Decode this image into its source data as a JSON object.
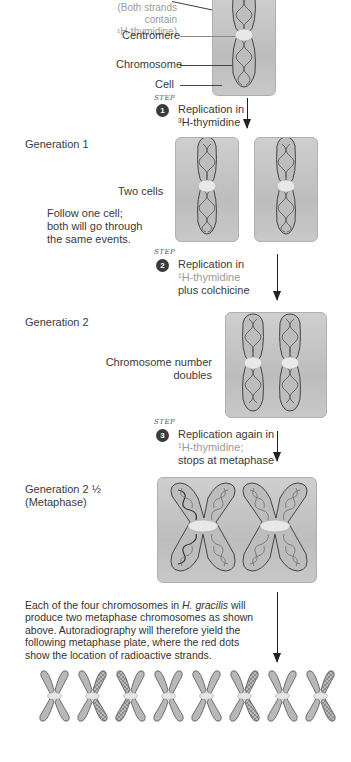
{
  "top": {
    "strands_note_line1": "(Both strands contain",
    "strands_note_line2": "¹H-thymidine)",
    "centromere_label": "Centromere",
    "chromosome_label": "Chromosome",
    "cell_label": "Cell"
  },
  "steps": [
    {
      "tag": "STEP",
      "number": "1",
      "line1": "Replication in",
      "line2": "³H-thymidine",
      "line3": ""
    },
    {
      "tag": "STEP",
      "number": "2",
      "line1": "Replication in",
      "line2": "¹H-thymidine",
      "line3": "plus colchicine"
    },
    {
      "tag": "STEP",
      "number": "3",
      "line1": "Replication again in",
      "line2": "¹H-thymidine;",
      "line3": "stops at metaphase"
    }
  ],
  "generation1": {
    "title": "Generation 1",
    "two_cells_label": "Two cells",
    "follow_line1": "Follow one cell;",
    "follow_line2": "both will go through",
    "follow_line3": "the same events."
  },
  "generation2": {
    "title": "Generation 2",
    "doubles_line1": "Chromosome number",
    "doubles_line2": "doubles"
  },
  "generation2_5": {
    "title_line1": "Generation 2 ½",
    "title_line2": "(Metaphase)"
  },
  "conclusion": {
    "line1_pre": "Each of the four chromosomes in ",
    "species": "H. gracilis",
    "line1_post": " will",
    "line2": "produce two metaphase chromosomes as shown",
    "line3": "above. Autoradiography will therefore yield the",
    "line4": "following metaphase plate, where the red dots",
    "line5": "show the location of radioactive strands."
  },
  "metaphase_plate": {
    "count": 8,
    "labeled_arms": [
      "none",
      "right",
      "left",
      "none",
      "none",
      "right",
      "none",
      "right"
    ]
  },
  "colors": {
    "cell_fill": "#c4c4c4",
    "chromosome_fill": "#b8b8b8",
    "centromere": "#e6e6e6",
    "step_badge": "#3a3a3a",
    "light_label": "#9a9a9a"
  }
}
